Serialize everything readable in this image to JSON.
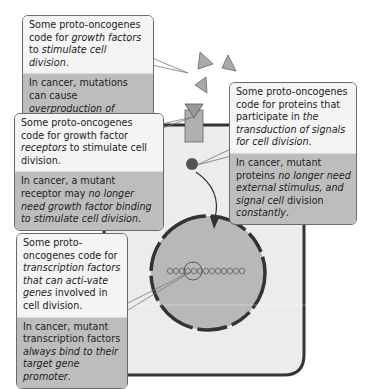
{
  "diagram": {
    "colors": {
      "cytoplasm": "#ececec",
      "nucleus": "#b8b8b8",
      "membrane": "#333333",
      "receptor": "#b0b0b0",
      "growth_factor": "#a9a9a9",
      "callout_top": "#f4f4f4",
      "callout_bottom": "#bdbdbd"
    },
    "callouts": [
      {
        "id": "growth-factors",
        "normal": [
          "Some proto-oncogenes code for ",
          {
            "i": "growth factors"
          },
          " to ",
          {
            "i": "stimulate cell division"
          },
          "."
        ],
        "cancer": [
          "In cancer, mutations can cause ",
          {
            "i": "overproduction of growth factors"
          },
          "."
        ]
      },
      {
        "id": "signal-transduction",
        "normal": [
          "Some proto-oncogenes code for proteins that participate in ",
          {
            "i": "the transduction of signals for cell division"
          },
          "."
        ],
        "cancer": [
          "In cancer, mutant proteins ",
          {
            "i": "no longer need external stimulus, and signal cell"
          },
          " division ",
          {
            "i": "constantly"
          },
          "."
        ]
      },
      {
        "id": "receptors",
        "normal": [
          "Some proto-oncogenes code for growth factor ",
          {
            "i": "receptors"
          },
          " to stimulate cell division."
        ],
        "cancer": [
          "In cancer, a mutant receptor may ",
          {
            "i": "no longer need growth factor binding to stimulate cell division"
          },
          "."
        ]
      },
      {
        "id": "transcription-factors",
        "normal": [
          "Some proto-oncogenes code for ",
          {
            "i": "transcription factors that can acti-vate genes"
          },
          " involved in cell division."
        ],
        "cancer": [
          "In cancer, mutant transcription factors ",
          {
            "i": "always bind to their target gene promoter"
          },
          "."
        ]
      }
    ]
  }
}
